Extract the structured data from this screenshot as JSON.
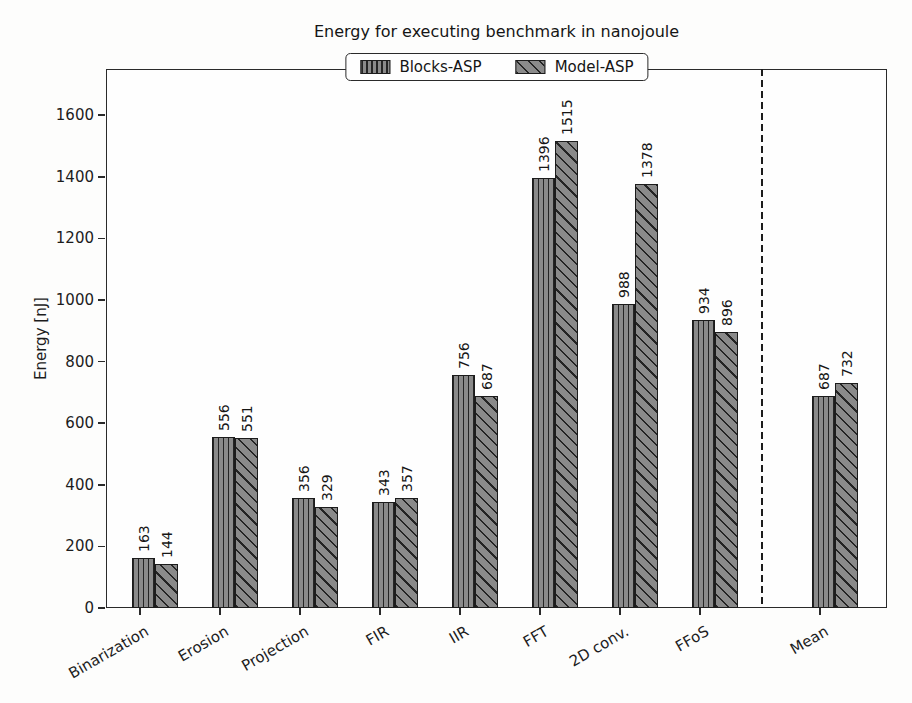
{
  "chart_data": {
    "type": "bar",
    "title": "Energy for executing benchmark in nanojoule",
    "ylabel": "Energy [nJ]",
    "xlabel": "",
    "categories": [
      "Binarization",
      "Erosion",
      "Projection",
      "FIR",
      "IIR",
      "FFT",
      "2D conv.",
      "FFoS",
      "Mean"
    ],
    "series": [
      {
        "name": "Blocks-ASP",
        "hatch": "vertical",
        "values": [
          163,
          556,
          356,
          343,
          756,
          1396,
          988,
          934,
          687
        ]
      },
      {
        "name": "Model-ASP",
        "hatch": "diagonal",
        "values": [
          144,
          551,
          329,
          357,
          687,
          1515,
          1378,
          896,
          732
        ]
      }
    ],
    "yticks": [
      0,
      200,
      400,
      600,
      800,
      1000,
      1200,
      1400,
      1600
    ],
    "ylim": [
      0,
      1750
    ],
    "grid": false,
    "value_labels_rotation": 90,
    "x_label_rotation": 30,
    "legend_position": "top-center",
    "separator": {
      "style": "dashed",
      "between": [
        "FFoS",
        "Mean"
      ]
    },
    "colors": {
      "bar_fill": "#8a8a8a",
      "hatch_line": "#242424",
      "bar_edge": "#1c1c1c",
      "frame": "#2a2a2a",
      "background": "#fefefe"
    }
  }
}
